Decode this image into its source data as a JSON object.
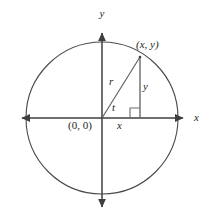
{
  "figure": {
    "kind": "unit-circle-diagram",
    "background_color": "#ffffff",
    "stroke_color": "#3f3f41",
    "text_color": "#231f20",
    "labels": {
      "y_axis": "y",
      "x_axis": "x",
      "point": "(x, y)",
      "origin": "(0, 0)",
      "radius": "r",
      "angle": "t",
      "opposite_side": "y",
      "adjacent_side": "x"
    },
    "geometry": {
      "center_x": 102,
      "center_y": 118,
      "radius": 76,
      "point_x": 140,
      "point_y": 57,
      "x_axis_left_arrow_x": 16,
      "x_axis_right_arrow_x": 189,
      "y_axis_top_arrow_y": 27,
      "y_axis_bottom_arrow_y": 213,
      "right_angle_size": 10
    }
  }
}
